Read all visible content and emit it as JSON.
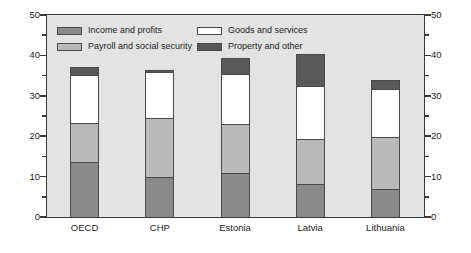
{
  "chart_data": {
    "type": "bar",
    "stacked": true,
    "title": "",
    "subtitle": "",
    "xlabel": "",
    "ylabel": "",
    "ylim": [
      0,
      50
    ],
    "y_ticks": [
      0,
      10,
      20,
      30,
      40,
      50
    ],
    "y_minor_ticks": [
      5,
      15,
      25,
      35,
      45
    ],
    "dual_axis": true,
    "grid": false,
    "legend_position": "inside-top-left",
    "categories": [
      "OECD",
      "CHP",
      "Estonia",
      "Latvia",
      "Lithuania"
    ],
    "series": [
      {
        "name": "Income and profits",
        "color": "#8a8a8a",
        "values": [
          13.5,
          9.9,
          11.0,
          8.2,
          7.0
        ]
      },
      {
        "name": "Payroll and social security",
        "color": "#b9b9b9",
        "values": [
          9.7,
          14.7,
          12.1,
          11.2,
          12.9
        ]
      },
      {
        "name": "Goods and services",
        "color": "#ffffff",
        "values": [
          12.0,
          11.3,
          12.3,
          13.0,
          11.9
        ]
      },
      {
        "name": "Property and other",
        "color": "#585858",
        "values": [
          1.9,
          0.4,
          3.9,
          7.9,
          2.0
        ]
      }
    ],
    "totals": [
      37.1,
      36.3,
      39.3,
      40.3,
      33.8
    ],
    "cumulative_tops": [
      [
        13.5,
        23.2,
        35.2,
        37.1
      ],
      [
        9.9,
        24.6,
        35.9,
        36.3
      ],
      [
        11.0,
        23.1,
        35.4,
        39.3
      ],
      [
        8.2,
        19.4,
        32.4,
        40.3
      ],
      [
        7.0,
        19.9,
        31.8,
        33.8
      ]
    ]
  },
  "legend": {
    "entries": [
      {
        "label": "Income and profits"
      },
      {
        "label": "Goods and services"
      },
      {
        "label": "Payroll and social security"
      },
      {
        "label": "Property and other"
      }
    ]
  },
  "axis": {
    "left_labels": [
      "50",
      "40",
      "30",
      "20",
      "10",
      "0"
    ],
    "right_labels": [
      "50",
      "40",
      "30",
      "20",
      "10",
      "0"
    ]
  },
  "colors": {
    "plot_background": "#e3e3e3",
    "axis_line": "#3a3a3a",
    "bar_outline": "#4a4a4a",
    "income_and_profits": "#8a8a8a",
    "payroll_and_social_security": "#b9b9b9",
    "goods_and_services": "#ffffff",
    "property_and_other": "#585858"
  }
}
